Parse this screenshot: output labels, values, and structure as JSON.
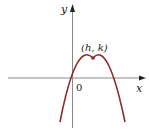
{
  "diagram": {
    "type": "parabola-graph",
    "axes": {
      "x_label": "x",
      "y_label": "y",
      "origin_label": "0"
    },
    "vertex": {
      "label": "(h, k)"
    },
    "curve": {
      "shape": "downward-opening parabola",
      "color": "#8b2a2a"
    },
    "axis_color": "#8a8a8a"
  }
}
